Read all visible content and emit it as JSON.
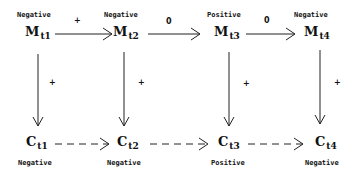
{
  "diagram": {
    "top_row": [
      {
        "symbol": "M",
        "subscript": "t1",
        "state": "Negative"
      },
      {
        "symbol": "M",
        "subscript": "t2",
        "state": "Negative"
      },
      {
        "symbol": "M",
        "subscript": "t3",
        "state": "Positive"
      },
      {
        "symbol": "M",
        "subscript": "t4",
        "state": "Negative"
      }
    ],
    "bottom_row": [
      {
        "symbol": "C",
        "subscript": "t1",
        "state": "Negative"
      },
      {
        "symbol": "C",
        "subscript": "t2",
        "state": "Negative"
      },
      {
        "symbol": "C",
        "subscript": "t3",
        "state": "Positive"
      },
      {
        "symbol": "C",
        "subscript": "t4",
        "state": "Negative"
      }
    ],
    "horizontal_edges": [
      {
        "from": "Mt1",
        "to": "Mt2",
        "sign": "+",
        "style": "solid"
      },
      {
        "from": "Mt2",
        "to": "Mt3",
        "sign": "0",
        "style": "solid"
      },
      {
        "from": "Mt3",
        "to": "Mt4",
        "sign": "0",
        "style": "solid"
      },
      {
        "from": "Ct1",
        "to": "Ct2",
        "sign": "",
        "style": "dashed"
      },
      {
        "from": "Ct2",
        "to": "Ct3",
        "sign": "",
        "style": "dashed"
      },
      {
        "from": "Ct3",
        "to": "Ct4",
        "sign": "",
        "style": "dashed"
      }
    ],
    "vertical_edges": [
      {
        "from": "Mt1",
        "to": "Ct1",
        "sign": "+"
      },
      {
        "from": "Mt2",
        "to": "Ct2",
        "sign": "+"
      },
      {
        "from": "Mt3",
        "to": "Ct3",
        "sign": "+"
      },
      {
        "from": "Mt4",
        "to": "Ct4",
        "sign": "+"
      }
    ],
    "colors": {
      "ink": "#111111",
      "background": "#ffffff"
    }
  }
}
